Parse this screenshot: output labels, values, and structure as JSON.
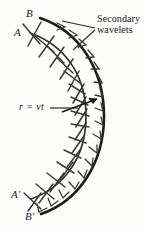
{
  "figure": {
    "kind": "huygens-secondary-wavelets-diagram",
    "background_color": "#fdfdfc",
    "ink_color": "#262626",
    "labels": {
      "A": "A",
      "B": "B",
      "A_prime": "A'",
      "B_prime": "B'",
      "radius": "r = vt",
      "secondary_line1": "Secondary",
      "secondary_line2": "wavelets"
    },
    "annotations": {
      "radius_arrow_name": "radius-vector-arrow",
      "leader_count": 2
    },
    "geometry": {
      "inner_wavefront_name": "inner-wavefront-arc-AAprime",
      "outer_wavefront_name": "outer-wavefront-arc-BBprime",
      "wavelet_tick_count": 19,
      "chevron_count": 17
    }
  }
}
